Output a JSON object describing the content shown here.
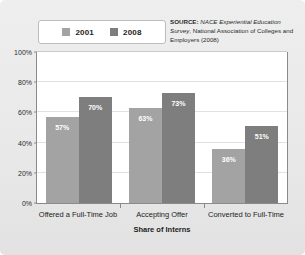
{
  "chart_data": {
    "type": "bar",
    "title": "",
    "xlabel": "Share of Interns",
    "ylabel": "",
    "categories": [
      "Offered a Full-Time Job",
      "Accepting Offer",
      "Converted to Full-Time"
    ],
    "series": [
      {
        "name": "2001",
        "color": "#a3a3a3",
        "values": [
          57,
          63,
          36
        ],
        "labels": [
          "57%",
          "63%",
          "36%"
        ]
      },
      {
        "name": "2008",
        "color": "#7e7e7e",
        "values": [
          70,
          73,
          51
        ],
        "labels": [
          "70%",
          "73%",
          "51%"
        ]
      }
    ],
    "ylim": [
      0,
      100
    ],
    "yticks": [
      0,
      20,
      40,
      60,
      80,
      100
    ],
    "ytick_labels": [
      "0%",
      "20%",
      "40%",
      "60%",
      "80%",
      "100%"
    ],
    "grid": true,
    "legend_position": "top-left",
    "value_label_position": "inside-top"
  },
  "legend": {
    "entries": [
      {
        "label": "2001",
        "color": "#a3a3a3"
      },
      {
        "label": "2008",
        "color": "#7e7e7e"
      }
    ]
  },
  "source": {
    "label": "SOURCE:",
    "italic_part": "NACE Experiential Education Survey",
    "rest": ", National Association of Colleges and Employers (2008)"
  },
  "colors": {
    "figure_background": "#e9e9e9",
    "plot_background": "#ffffff",
    "axis": "#8a8a8a",
    "gridline": "#e1e1e1",
    "series_2001": "#a3a3a3",
    "series_2008": "#7e7e7e",
    "text": "#1c1c1c"
  }
}
